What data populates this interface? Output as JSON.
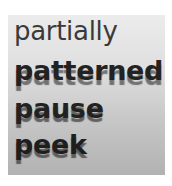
{
  "image": {
    "words": [
      "partially",
      "patterned",
      "pause",
      "peek"
    ],
    "background": {
      "top": "#ececec",
      "bottom": "#b2b2b2"
    },
    "frame": "#ffffff"
  }
}
